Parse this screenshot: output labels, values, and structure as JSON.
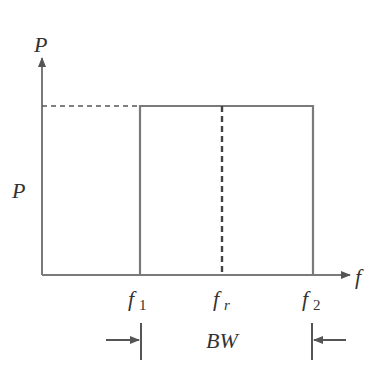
{
  "diagram": {
    "type": "ideal bandpass power spectrum",
    "y_axis_label": "P",
    "x_axis_label": "f",
    "level_label": "P",
    "markers": [
      {
        "name": "f",
        "sub": "1"
      },
      {
        "name": "f",
        "sub": "r"
      },
      {
        "name": "f",
        "sub": "2"
      }
    ],
    "bandwidth_label": "BW",
    "colors": {
      "line": "#7a7a7a",
      "text": "#333333",
      "dashed": "#444444"
    }
  }
}
